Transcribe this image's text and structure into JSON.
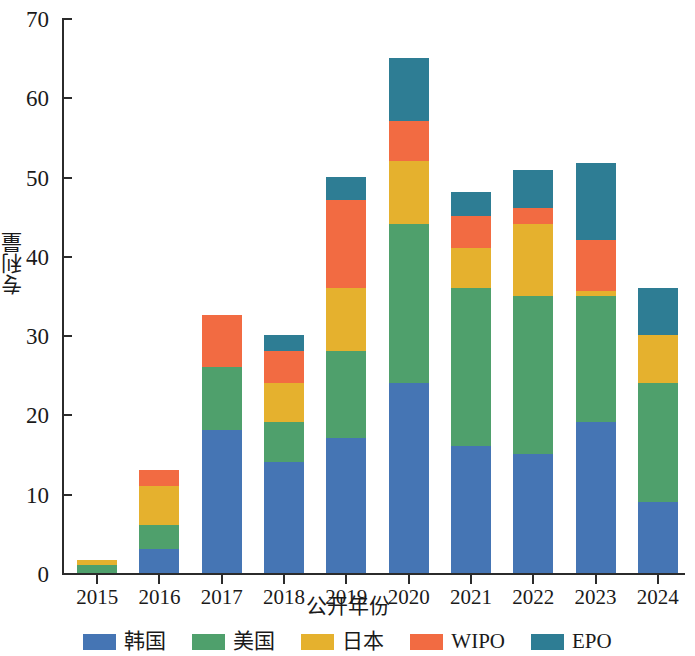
{
  "chart_data": {
    "type": "bar",
    "stacked": true,
    "title": "",
    "xlabel": "公开年份",
    "ylabel": "专利量",
    "categories": [
      "2015",
      "2016",
      "2017",
      "2018",
      "2019",
      "2020",
      "2021",
      "2022",
      "2023",
      "2024"
    ],
    "ylim": [
      0,
      70
    ],
    "yticks": [
      0,
      10,
      20,
      30,
      40,
      50,
      60,
      70
    ],
    "ytick_labels": [
      "0",
      "10",
      "20",
      "30",
      "40",
      "50",
      "60",
      "70"
    ],
    "grid": false,
    "legend_position": "bottom",
    "series": [
      {
        "name": "韩国",
        "color": "#4575B4",
        "values": [
          0,
          3,
          18,
          14,
          17,
          24,
          16,
          15,
          19,
          9
        ]
      },
      {
        "name": "美国",
        "color": "#4FA06C",
        "values": [
          1,
          3,
          8,
          5,
          11,
          20,
          20,
          20,
          16,
          15
        ]
      },
      {
        "name": "日本",
        "color": "#E5B12E",
        "values": [
          0.7,
          5,
          0,
          5,
          8,
          8,
          5,
          9,
          0.6,
          6
        ]
      },
      {
        "name": "WIPO",
        "color": "#F26B42",
        "values": [
          0,
          2,
          6.5,
          4,
          11,
          5,
          4,
          2,
          6.4,
          0
        ]
      },
      {
        "name": "EPO",
        "color": "#2E7D94",
        "values": [
          0,
          0,
          0,
          2,
          3,
          8,
          3,
          4.8,
          9.7,
          6
        ]
      }
    ],
    "totals": [
      1.7,
      13,
      32.5,
      30,
      50,
      65,
      48,
      50.8,
      51.7,
      36
    ]
  },
  "legend": {
    "items": [
      {
        "label": "韩国",
        "color": "#4575B4"
      },
      {
        "label": "美国",
        "color": "#4FA06C"
      },
      {
        "label": "日本",
        "color": "#E5B12E"
      },
      {
        "label": "WIPO",
        "color": "#F26B42"
      },
      {
        "label": "EPO",
        "color": "#2E7D94"
      }
    ]
  },
  "axes": {
    "y_title": "专利量",
    "x_title": "公开年份"
  }
}
